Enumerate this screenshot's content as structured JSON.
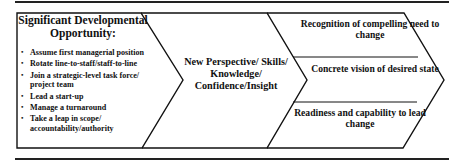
{
  "diagram": {
    "left_box": {
      "title": "Significant Developmental Opportunity:",
      "bullets": [
        "Assume first managerial position",
        "Rotate line-to-staff/staff-to-line",
        "Join a strategic-level task force/ project team",
        "Lead a start-up",
        "Manage a turnaround",
        "Take a leap in scope/ accountability/authority"
      ]
    },
    "middle_chevron": {
      "text": "New Perspective/ Skills/ Knowledge/ Confidence/Insight"
    },
    "right_chevron": {
      "rows": [
        "Recognition of compelling need to change",
        "Concrete vision of desired state",
        "Readiness and capability to lead change"
      ]
    },
    "colors": {
      "stroke": "#111111",
      "background": "#ffffff"
    }
  }
}
